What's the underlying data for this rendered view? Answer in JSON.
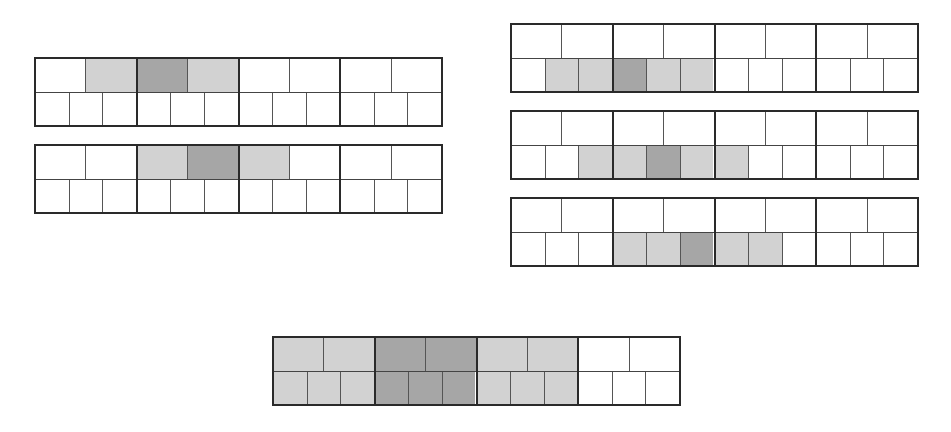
{
  "colors": {
    "empty": "#ffffff",
    "light": "#d2d2d2",
    "dark": "#a6a6a6",
    "border": "#2a2a2a"
  },
  "grids": [
    {
      "id": "grid-top-left-1",
      "x": 34,
      "y": 57,
      "blocks": [
        {
          "top": [
            "empty",
            "light"
          ],
          "bottom": [
            "empty",
            "empty",
            "empty"
          ]
        },
        {
          "top": [
            "dark",
            "light"
          ],
          "bottom": [
            "empty",
            "empty",
            "empty"
          ]
        },
        {
          "top": [
            "empty",
            "empty"
          ],
          "bottom": [
            "empty",
            "empty",
            "empty"
          ]
        },
        {
          "top": [
            "empty",
            "empty"
          ],
          "bottom": [
            "empty",
            "empty",
            "empty"
          ]
        }
      ]
    },
    {
      "id": "grid-top-left-2",
      "x": 34,
      "y": 144,
      "blocks": [
        {
          "top": [
            "empty",
            "empty"
          ],
          "bottom": [
            "empty",
            "empty",
            "empty"
          ]
        },
        {
          "top": [
            "light",
            "dark"
          ],
          "bottom": [
            "empty",
            "empty",
            "empty"
          ]
        },
        {
          "top": [
            "light",
            "empty"
          ],
          "bottom": [
            "empty",
            "empty",
            "empty"
          ]
        },
        {
          "top": [
            "empty",
            "empty"
          ],
          "bottom": [
            "empty",
            "empty",
            "empty"
          ]
        }
      ]
    },
    {
      "id": "grid-right-1",
      "x": 510,
      "y": 23,
      "blocks": [
        {
          "top": [
            "empty",
            "empty"
          ],
          "bottom": [
            "empty",
            "light",
            "light"
          ]
        },
        {
          "top": [
            "empty",
            "empty"
          ],
          "bottom": [
            "dark",
            "light",
            "light"
          ]
        },
        {
          "top": [
            "empty",
            "empty"
          ],
          "bottom": [
            "empty",
            "empty",
            "empty"
          ]
        },
        {
          "top": [
            "empty",
            "empty"
          ],
          "bottom": [
            "empty",
            "empty",
            "empty"
          ]
        }
      ]
    },
    {
      "id": "grid-right-2",
      "x": 510,
      "y": 110,
      "blocks": [
        {
          "top": [
            "empty",
            "empty"
          ],
          "bottom": [
            "empty",
            "empty",
            "light"
          ]
        },
        {
          "top": [
            "empty",
            "empty"
          ],
          "bottom": [
            "light",
            "dark",
            "light"
          ]
        },
        {
          "top": [
            "empty",
            "empty"
          ],
          "bottom": [
            "light",
            "empty",
            "empty"
          ]
        },
        {
          "top": [
            "empty",
            "empty"
          ],
          "bottom": [
            "empty",
            "empty",
            "empty"
          ]
        }
      ]
    },
    {
      "id": "grid-right-3",
      "x": 510,
      "y": 197,
      "blocks": [
        {
          "top": [
            "empty",
            "empty"
          ],
          "bottom": [
            "empty",
            "empty",
            "empty"
          ]
        },
        {
          "top": [
            "empty",
            "empty"
          ],
          "bottom": [
            "light",
            "light",
            "dark"
          ]
        },
        {
          "top": [
            "empty",
            "empty"
          ],
          "bottom": [
            "light",
            "light",
            "empty"
          ]
        },
        {
          "top": [
            "empty",
            "empty"
          ],
          "bottom": [
            "empty",
            "empty",
            "empty"
          ]
        }
      ]
    },
    {
      "id": "grid-bottom-summary",
      "x": 272,
      "y": 336,
      "blocks": [
        {
          "top": [
            "light",
            "light"
          ],
          "bottom": [
            "light",
            "light",
            "light"
          ]
        },
        {
          "top": [
            "dark",
            "dark"
          ],
          "bottom": [
            "dark",
            "dark",
            "dark"
          ]
        },
        {
          "top": [
            "light",
            "light"
          ],
          "bottom": [
            "light",
            "light",
            "light"
          ]
        },
        {
          "top": [
            "empty",
            "empty"
          ],
          "bottom": [
            "empty",
            "empty",
            "empty"
          ]
        }
      ]
    }
  ]
}
